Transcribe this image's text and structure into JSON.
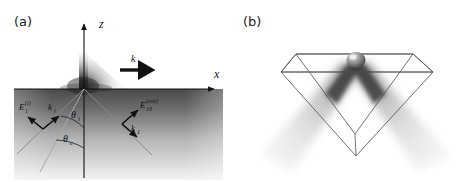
{
  "figure": {
    "background_color": "#ffffff",
    "panels": [
      {
        "id": "a",
        "label": "(a)",
        "description": "Total internal reflection geometry with evanescent field at an interface",
        "axes": {
          "vertical_label": "z",
          "horizontal_label": "x"
        },
        "annotations": {
          "evanescent_wavevector": "k",
          "evanescent_wavevector_sub": "x",
          "incident_field": "E",
          "incident_field_sub": "1",
          "incident_field_sup": "(i)",
          "incident_wavevector": "k",
          "incident_wavevector_sub": "i",
          "output_field": "E",
          "output_field_sub": "10",
          "output_field_sup": "(out)",
          "reflected_wavevector": "k",
          "reflected_wavevector_sub": "1",
          "angle_incidence": "θ",
          "angle_incidence_sub": "i",
          "angle_critical": "θ",
          "angle_critical_sub": "c"
        },
        "colors": {
          "axis": "#111111",
          "ray": "#777777",
          "vector": "#111111",
          "substrate_top": "#4a4a4a",
          "substrate_bottom": "#f2f2f2",
          "evanescent": "#1e1e1e"
        }
      },
      {
        "id": "b",
        "label": "(b)",
        "description": "Wireframe prism with bead at apex and two diverging scattered beams",
        "colors": {
          "wireframe": "#555555",
          "bead": "#4d4d4d",
          "beam": "#9a9a9a"
        }
      }
    ]
  }
}
